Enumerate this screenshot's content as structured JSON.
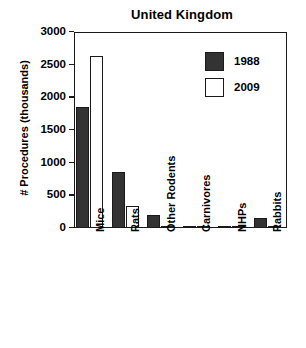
{
  "chart_data": {
    "type": "bar",
    "title": "United Kingdom",
    "xlabel": "",
    "ylabel": "# Procedures (thousands)",
    "categories": [
      "Mice",
      "Rats",
      "Other Rodents",
      "Carnivores",
      "NHPs",
      "Rabbits"
    ],
    "series": [
      {
        "name": "1988",
        "color": "#333333",
        "values": [
          1850,
          857,
          200,
          35,
          10,
          160
        ]
      },
      {
        "name": "2009",
        "color": "#ffffff",
        "values": [
          2640,
          337,
          30,
          15,
          8,
          20
        ]
      }
    ],
    "ylim": [
      0,
      3000
    ],
    "yticks": [
      0,
      500,
      1000,
      1500,
      2000,
      2500,
      3000
    ],
    "ytick_labels": [
      "0",
      "500",
      "1000",
      "1500",
      "2000",
      "2500",
      "3000"
    ],
    "grid": false,
    "legend_position": "top-right",
    "frame": "box"
  },
  "legend": {
    "entries": [
      {
        "label": "1988",
        "style": "filled"
      },
      {
        "label": "2009",
        "style": "outlined"
      }
    ]
  }
}
